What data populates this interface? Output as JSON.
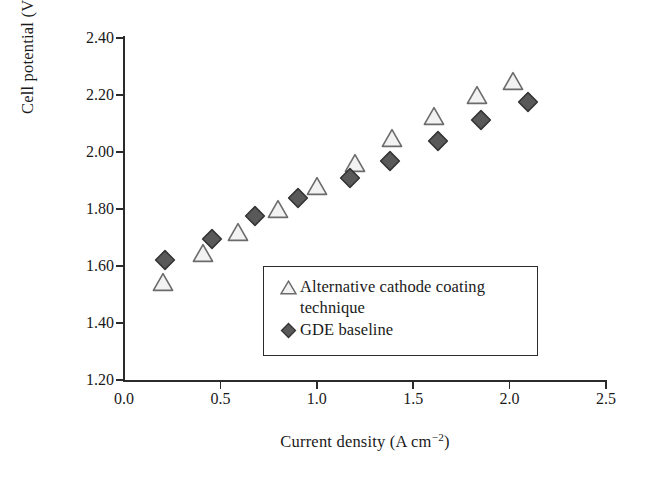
{
  "chart_data": {
    "type": "scatter",
    "title": "",
    "xlabel": "Current density (A cm−2)",
    "xlabel_base": "Current density (A cm",
    "xlabel_sup": "−2",
    "xlabel_tail": ")",
    "ylabel": "Cell potential (V)",
    "xlim": [
      0.0,
      2.5
    ],
    "ylim": [
      1.2,
      2.4
    ],
    "xticks": [
      "0.0",
      "0.5",
      "1.0",
      "1.5",
      "2.0",
      "2.5"
    ],
    "xtick_values": [
      0.0,
      0.5,
      1.0,
      1.5,
      2.0,
      2.5
    ],
    "yticks": [
      "1.20",
      "1.40",
      "1.60",
      "1.80",
      "2.00",
      "2.20",
      "2.40"
    ],
    "ytick_values": [
      1.2,
      1.4,
      1.6,
      1.8,
      2.0,
      2.2,
      2.4
    ],
    "grid": false,
    "legend_position": "lower-center",
    "series": [
      {
        "name": "Alternative cathode coating technique",
        "marker": "triangle-open",
        "fill": "#f2f2f2",
        "stroke": "#6b6b6b",
        "points": [
          [
            0.2,
            1.545
          ],
          [
            0.41,
            1.645
          ],
          [
            0.59,
            1.72
          ],
          [
            0.8,
            1.8
          ],
          [
            1.0,
            1.88
          ],
          [
            1.2,
            1.96
          ],
          [
            1.39,
            2.05
          ],
          [
            1.61,
            2.125
          ],
          [
            1.83,
            2.2
          ],
          [
            2.02,
            2.25
          ]
        ]
      },
      {
        "name": "GDE baseline",
        "marker": "diamond-filled",
        "fill": "#595959",
        "stroke": "#333333",
        "points": [
          [
            0.215,
            1.62
          ],
          [
            0.455,
            1.695
          ],
          [
            0.68,
            1.775
          ],
          [
            0.9,
            1.84
          ],
          [
            1.17,
            1.91
          ],
          [
            1.38,
            1.97
          ],
          [
            1.63,
            2.04
          ],
          [
            1.85,
            2.112
          ],
          [
            2.095,
            2.175
          ]
        ]
      }
    ]
  },
  "legend": {
    "entries": [
      {
        "label_line1": "Alternative cathode coating",
        "label_line2": "technique",
        "marker": "triangle-open-icon"
      },
      {
        "label_line1": "GDE baseline",
        "label_line2": "",
        "marker": "diamond-filled-icon"
      }
    ]
  },
  "colors": {
    "axis": "#2b2b2b",
    "text": "#1a1a1a",
    "background": "#ffffff",
    "triangle_fill": "#f2f2f2",
    "triangle_stroke": "#6b6b6b",
    "diamond_fill": "#595959",
    "diamond_stroke": "#333333"
  }
}
